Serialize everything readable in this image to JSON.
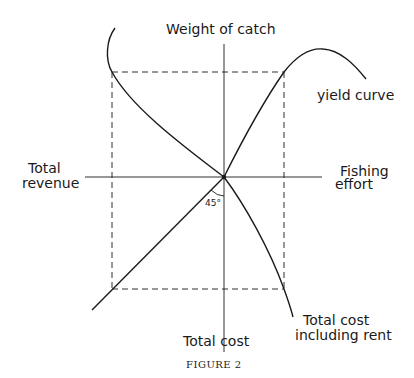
{
  "figure": {
    "caption": "FIGURE 2",
    "axis_labels": {
      "top": "Weight of catch",
      "left_line1": "Total",
      "left_line2": "revenue",
      "right_line1": "Fishing",
      "right_line2": "effort",
      "bottom": "Total cost"
    },
    "curve_labels": {
      "yield": "yield curve",
      "cost_line1": "Total cost",
      "cost_line2": "including rent"
    },
    "angle_label": "45°"
  },
  "diagram": {
    "type": "four-quadrant economic diagram",
    "quadrants": {
      "NE": "Yield curve: weight of catch vs fishing effort (rises, peaks, declines)",
      "NW": "Total revenue curve mapped from weight of catch",
      "SW": "45° transfer line between total revenue and total cost",
      "SE": "Total cost including rent vs fishing effort"
    },
    "dashed_rectangle": "Connects equilibrium points across all four quadrants"
  }
}
